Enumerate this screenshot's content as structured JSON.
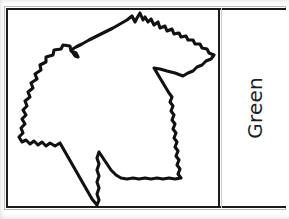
{
  "document": {
    "type": "scanned-worksheet-table",
    "background_color": "#ffffff",
    "frame_color": "#1b1b1b",
    "frame_ghost_color": "#b9b9b9"
  },
  "table": {
    "rows": [
      {
        "cells": [
          {
            "name": "leaf-illustration-cell",
            "content_type": "illustration",
            "illustration": {
              "subject": "maple leaf outline",
              "outline_color": "#111111",
              "outline_style": "hand-drawn serrated contour",
              "fill_color": "#ffffff",
              "vein_color": "#b7b7b7",
              "vein_style": "dotted",
              "vein_count": 9,
              "petiole_point": "left-upper notch"
            }
          },
          {
            "name": "label-cell",
            "content_type": "text",
            "label": "Green",
            "text_color": "#1d1d1d",
            "rotation_degrees": -90,
            "font_size_px": 20
          }
        ]
      }
    ]
  },
  "label_cell": {
    "text": "Green"
  },
  "illustration_cell": {
    "alt": "Outline drawing of a maple leaf with dotted veins"
  }
}
